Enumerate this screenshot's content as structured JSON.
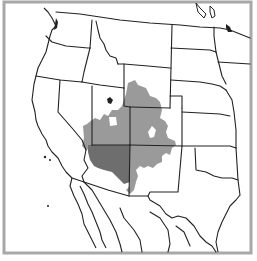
{
  "map": {
    "title": "",
    "region": "Western United States with northern Mexico",
    "style": "grayscale state-boundary map",
    "colors": {
      "background": "#ffffff",
      "frame": "#a8a8a8",
      "boundaries": "#222222",
      "shade_light": "#9a9a9a",
      "shade_dark": "#6e6e6e"
    },
    "shaded_regions": [
      {
        "name": "light-gray-region",
        "tone": "light",
        "states_covered": [
          "Utah",
          "Colorado",
          "Wyoming (south)",
          "New Mexico (north/west)",
          "Nevada (east)"
        ]
      },
      {
        "name": "dark-gray-region",
        "tone": "dark",
        "states_covered": [
          "Arizona (north)"
        ]
      }
    ],
    "legend": null
  }
}
